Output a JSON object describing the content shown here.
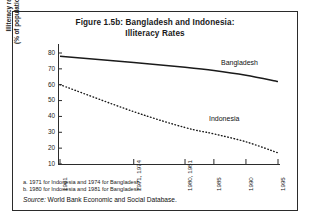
{
  "figure": {
    "title_line1": "Figure 1.5b: Bangladesh and Indonesia:",
    "title_line2": "Illiteracy Rates",
    "footnote_a": "a. 1971 for Indonesia and 1974 for Bangladesh.",
    "footnote_b": "b. 1980 for Indonesia and 1981 for Bangladesh.",
    "source_label": "Source:",
    "source_text": " World Bank Economic and Social Database."
  },
  "chart_data": {
    "type": "line",
    "title": "Figure 1.5b: Bangladesh and Indonesia: Illiteracy Rates",
    "xlabel": "",
    "ylabel_line1": "Illiteracy rate",
    "ylabel_line2": "(% of population 15+)",
    "ylim": [
      10,
      80
    ],
    "yticks": [
      10,
      20,
      30,
      40,
      50,
      60,
      70,
      80
    ],
    "xticks": [
      "1961",
      "1971, 1974",
      "1980, 1981",
      "1985",
      "1990",
      "1995"
    ],
    "xtick_positions": [
      1961,
      1972.5,
      1980.5,
      1985,
      1990,
      1995
    ],
    "xlim": [
      1961,
      1995
    ],
    "grid": false,
    "legend": "inline-annotations",
    "series": [
      {
        "name": "Bangladesh",
        "style": "solid",
        "color": "#1a1a1a",
        "x": [
          1961,
          1972.5,
          1980.5,
          1985,
          1990,
          1995
        ],
        "values": [
          78,
          74,
          71,
          69,
          66,
          62
        ]
      },
      {
        "name": "Indonesia",
        "style": "dotted",
        "color": "#1a1a1a",
        "x": [
          1961,
          1972.5,
          1980.5,
          1985,
          1990,
          1995
        ],
        "values": [
          60,
          43,
          33,
          29,
          24,
          17
        ]
      }
    ]
  }
}
